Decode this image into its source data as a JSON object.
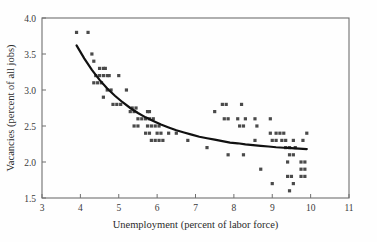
{
  "chart_data": {
    "type": "scatter",
    "title": "",
    "subtitle": "",
    "xlabel": "Unemployment  (percent of labor force)",
    "ylabel": "Vacancies (percent of all jobs)",
    "xlim": [
      3,
      11
    ],
    "ylim": [
      1.5,
      4.0
    ],
    "xticks": [
      3,
      4,
      5,
      6,
      7,
      8,
      9,
      10,
      11
    ],
    "xtick_labels": [
      "3",
      "4",
      "5",
      "6",
      "7",
      "8",
      "9",
      "10",
      "11"
    ],
    "yticks": [
      1.5,
      2.0,
      2.5,
      3.0,
      3.5,
      4.0
    ],
    "ytick_labels": [
      "1.5",
      "2.0",
      "2.5",
      "3.0",
      "3.5",
      "4.0"
    ],
    "grid": false,
    "legend": false,
    "legend_position": "none",
    "marker_color": "#4a4a4a",
    "curve_color": "#111111",
    "frame_color": "#6f6f6f",
    "background_color": "#fefefe",
    "series": [
      {
        "name": "observations",
        "type": "scatter",
        "points": [
          [
            3.9,
            3.8
          ],
          [
            4.2,
            3.8
          ],
          [
            4.3,
            3.5
          ],
          [
            4.35,
            3.4
          ],
          [
            4.5,
            3.3
          ],
          [
            4.6,
            3.3
          ],
          [
            4.65,
            3.3
          ],
          [
            4.4,
            3.2
          ],
          [
            4.5,
            3.2
          ],
          [
            4.6,
            3.2
          ],
          [
            4.7,
            3.2
          ],
          [
            4.75,
            3.2
          ],
          [
            5.0,
            3.2
          ],
          [
            4.35,
            3.1
          ],
          [
            4.45,
            3.1
          ],
          [
            4.55,
            3.1
          ],
          [
            4.7,
            3.0
          ],
          [
            4.8,
            3.0
          ],
          [
            5.2,
            3.0
          ],
          [
            4.6,
            2.9
          ],
          [
            4.85,
            2.8
          ],
          [
            4.95,
            2.8
          ],
          [
            5.05,
            2.8
          ],
          [
            5.35,
            2.75
          ],
          [
            5.45,
            2.75
          ],
          [
            5.3,
            2.7
          ],
          [
            5.4,
            2.7
          ],
          [
            5.75,
            2.7
          ],
          [
            5.8,
            2.7
          ],
          [
            5.5,
            2.6
          ],
          [
            5.6,
            2.6
          ],
          [
            5.7,
            2.6
          ],
          [
            5.8,
            2.6
          ],
          [
            5.9,
            2.6
          ],
          [
            5.4,
            2.5
          ],
          [
            5.5,
            2.5
          ],
          [
            5.75,
            2.5
          ],
          [
            5.85,
            2.5
          ],
          [
            5.95,
            2.5
          ],
          [
            6.05,
            2.5
          ],
          [
            5.7,
            2.4
          ],
          [
            5.8,
            2.4
          ],
          [
            6.0,
            2.4
          ],
          [
            6.1,
            2.4
          ],
          [
            6.3,
            2.4
          ],
          [
            6.5,
            2.4
          ],
          [
            5.85,
            2.3
          ],
          [
            5.95,
            2.3
          ],
          [
            6.05,
            2.3
          ],
          [
            6.15,
            2.3
          ],
          [
            6.8,
            2.3
          ],
          [
            7.3,
            2.2
          ],
          [
            7.5,
            2.7
          ],
          [
            7.7,
            2.8
          ],
          [
            7.8,
            2.8
          ],
          [
            8.2,
            2.8
          ],
          [
            7.75,
            2.6
          ],
          [
            7.85,
            2.6
          ],
          [
            8.1,
            2.6
          ],
          [
            8.3,
            2.6
          ],
          [
            8.55,
            2.6
          ],
          [
            8.95,
            2.6
          ],
          [
            8.15,
            2.5
          ],
          [
            8.25,
            2.5
          ],
          [
            8.6,
            2.5
          ],
          [
            8.55,
            2.3
          ],
          [
            8.95,
            2.4
          ],
          [
            9.1,
            2.4
          ],
          [
            9.2,
            2.4
          ],
          [
            9.3,
            2.4
          ],
          [
            9.0,
            2.3
          ],
          [
            9.1,
            2.3
          ],
          [
            9.25,
            2.3
          ],
          [
            9.35,
            2.3
          ],
          [
            9.55,
            2.3
          ],
          [
            9.8,
            2.3
          ],
          [
            9.9,
            2.4
          ],
          [
            7.85,
            2.1
          ],
          [
            8.25,
            2.1
          ],
          [
            9.35,
            2.2
          ],
          [
            9.45,
            2.2
          ],
          [
            9.6,
            2.2
          ],
          [
            9.45,
            2.1
          ],
          [
            9.55,
            2.1
          ],
          [
            9.4,
            2.0
          ],
          [
            9.75,
            2.0
          ],
          [
            9.85,
            2.0
          ],
          [
            9.75,
            1.9
          ],
          [
            9.85,
            1.9
          ],
          [
            8.7,
            1.9
          ],
          [
            9.4,
            1.8
          ],
          [
            9.5,
            1.8
          ],
          [
            9.75,
            1.8
          ],
          [
            9.85,
            1.8
          ],
          [
            9.0,
            1.7
          ],
          [
            9.55,
            1.7
          ],
          [
            9.45,
            1.6
          ]
        ]
      },
      {
        "name": "fitted-beveridge-curve",
        "type": "line",
        "points": [
          [
            3.9,
            3.62
          ],
          [
            4.1,
            3.44
          ],
          [
            4.3,
            3.28
          ],
          [
            4.5,
            3.14
          ],
          [
            4.7,
            3.02
          ],
          [
            4.9,
            2.92
          ],
          [
            5.1,
            2.83
          ],
          [
            5.3,
            2.75
          ],
          [
            5.5,
            2.68
          ],
          [
            5.7,
            2.62
          ],
          [
            5.9,
            2.57
          ],
          [
            6.1,
            2.52
          ],
          [
            6.3,
            2.48
          ],
          [
            6.5,
            2.44
          ],
          [
            6.7,
            2.41
          ],
          [
            6.9,
            2.38
          ],
          [
            7.1,
            2.35
          ],
          [
            7.3,
            2.33
          ],
          [
            7.5,
            2.31
          ],
          [
            7.7,
            2.29
          ],
          [
            7.9,
            2.27
          ],
          [
            8.1,
            2.26
          ],
          [
            8.3,
            2.245
          ],
          [
            8.5,
            2.235
          ],
          [
            8.7,
            2.225
          ],
          [
            8.9,
            2.215
          ],
          [
            9.1,
            2.205
          ],
          [
            9.3,
            2.198
          ],
          [
            9.5,
            2.192
          ],
          [
            9.7,
            2.186
          ],
          [
            9.9,
            2.18
          ]
        ]
      }
    ]
  },
  "axes": {
    "x_title": "Unemployment  (percent of labor force)",
    "y_title": "Vacancies (percent of all jobs)"
  }
}
